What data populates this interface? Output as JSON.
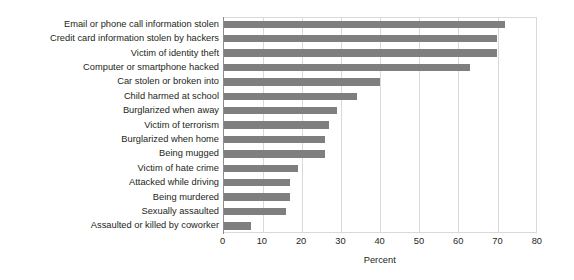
{
  "chart_data": {
    "type": "bar",
    "orientation": "horizontal",
    "title": "",
    "subtitle": "",
    "xlabel": "Percent",
    "ylabel": "",
    "xlim": [
      0,
      80
    ],
    "xticks": [
      0,
      10,
      20,
      30,
      40,
      50,
      60,
      70,
      80
    ],
    "xtick_labels": [
      "0",
      "10",
      "20",
      "30",
      "40",
      "50",
      "60",
      "70",
      "80"
    ],
    "grid": "vertical",
    "legend": "none",
    "bar_color": "#7f7f7f",
    "categories": [
      "Email or phone call information stolen",
      "Credit card information stolen by hackers",
      "Victim of identity theft",
      "Computer or smartphone hacked",
      "Car stolen or broken into",
      "Child harmed at school",
      "Burglarized when away",
      "Victim of terrorism",
      "Burglarized when home",
      "Being mugged",
      "Victim of hate crime",
      "Attacked while driving",
      "Being murdered",
      "Sexually assaulted",
      "Assaulted or killed by coworker"
    ],
    "values": [
      72,
      70,
      70,
      63,
      40,
      34,
      29,
      27,
      26,
      26,
      19,
      17,
      17,
      16,
      7
    ]
  }
}
